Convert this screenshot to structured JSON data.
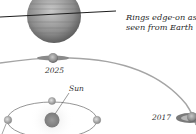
{
  "diagram": {
    "caption_line1": "Rings edge-on as",
    "caption_line2": "seen from Earth",
    "labels": {
      "year_2025": "2025",
      "year_2017": "2017",
      "sun": "Sun"
    },
    "elements": [
      {
        "name": "saturn-large",
        "description": "Saturn with rings edge-on (thin line)"
      },
      {
        "name": "saturn-orbit",
        "description": "Arc of Saturn's orbit"
      },
      {
        "name": "saturn-2025",
        "description": "Saturn at 2025 position, rings edge-on"
      },
      {
        "name": "saturn-2017",
        "description": "Saturn at 2017 position, rings tilted"
      },
      {
        "name": "sun",
        "description": "Sun at center of Earth's orbit"
      },
      {
        "name": "earth-orbit",
        "description": "Earth's orbit ellipse with Earth positions"
      }
    ],
    "colors": {
      "background": "#ffffff",
      "planet": "#8a8a8a",
      "orbit_line": "#9a9a9a",
      "text": "#333333"
    }
  }
}
